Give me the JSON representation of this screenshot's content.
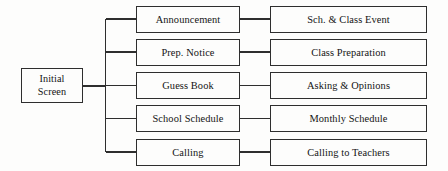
{
  "diagram": {
    "type": "tree-hierarchy",
    "colors": {
      "background": "#fdfdfc",
      "line": "#2e2e2e",
      "box_border": "#2e2e2e",
      "box_fill": "#fdfdfc",
      "text": "#141414"
    },
    "root": {
      "label": "Initial\nScreen",
      "line_1": "Initial",
      "line_2": "Screen"
    },
    "rows": [
      {
        "menu": "Announcement",
        "detail": "Sch. & Class Event"
      },
      {
        "menu": "Prep. Notice",
        "detail": "Class Preparation"
      },
      {
        "menu": "Guess Book",
        "detail": "Asking & Opinions"
      },
      {
        "menu": "School Schedule",
        "detail": "Monthly Schedule"
      },
      {
        "menu": "Calling",
        "detail": "Calling to Teachers"
      }
    ]
  }
}
